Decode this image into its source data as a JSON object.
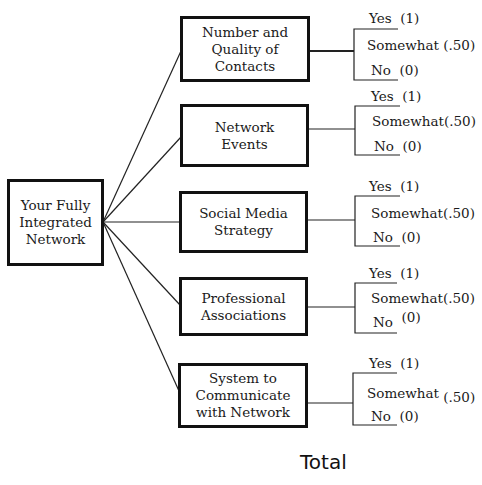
{
  "root": {
    "label": "Your Fully\nIntegrated\nNetwork"
  },
  "categories": [
    {
      "label": "Number and\nQuality of\nContacts",
      "options": [
        {
          "label": "Yes",
          "score": "(1)"
        },
        {
          "label": "Somewhat",
          "score": "(.50)"
        },
        {
          "label": "No",
          "score": "(0)"
        }
      ]
    },
    {
      "label": "Network\nEvents",
      "options": [
        {
          "label": "Yes",
          "score": "(1)"
        },
        {
          "label": "Somewhat",
          "score": "(.50)"
        },
        {
          "label": "No",
          "score": "(0)"
        }
      ]
    },
    {
      "label": "Social Media\nStrategy",
      "options": [
        {
          "label": "Yes",
          "score": "(1)"
        },
        {
          "label": "Somewhat",
          "score": "(.50)"
        },
        {
          "label": "No",
          "score": "(0)"
        }
      ]
    },
    {
      "label": "Professional\nAssociations",
      "options": [
        {
          "label": "Yes",
          "score": "(1)"
        },
        {
          "label": "Somewhat",
          "score": "(.50)"
        },
        {
          "label": "No",
          "score": "(0)"
        }
      ]
    },
    {
      "label": "System to\nCommunicate\nwith Network",
      "options": [
        {
          "label": "Yes",
          "score": "(1)"
        },
        {
          "label": "Somewhat",
          "score": "(.50)"
        },
        {
          "label": "No",
          "score": "(0)"
        }
      ]
    }
  ],
  "footer": {
    "total_label": "Total"
  }
}
